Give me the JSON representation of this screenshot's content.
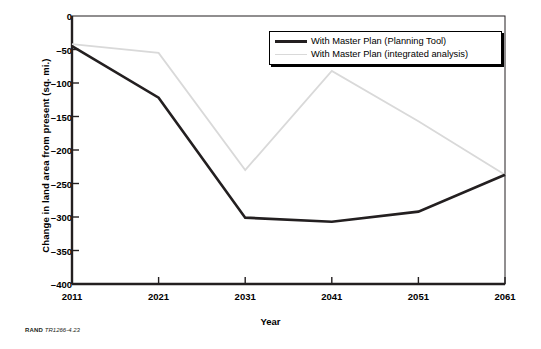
{
  "figure": {
    "credit_prefix": "RAND",
    "credit_id": "TR1266-4.23"
  },
  "chart_data": {
    "type": "line",
    "title": "",
    "xlabel": "Year",
    "ylabel": "Change in land area from present (sq. mi.)",
    "x": [
      2011,
      2021,
      2031,
      2041,
      2051,
      2061
    ],
    "xtick_labels": [
      "2011",
      "2021",
      "2031",
      "2041",
      "2051",
      "2061"
    ],
    "ytick_labels": [
      "0",
      "–50",
      "–100",
      "–150",
      "–200",
      "–250",
      "–300",
      "–350",
      "–400"
    ],
    "ytick_values": [
      0,
      -50,
      -100,
      -150,
      -200,
      -250,
      -300,
      -350,
      -400
    ],
    "ylim": [
      -400,
      0
    ],
    "xlim": [
      2011,
      2061
    ],
    "grid": false,
    "legend_position": "top-right",
    "series": [
      {
        "name": "With Master Plan (Planning Tool)",
        "color": "#231f20",
        "width": 2.6,
        "values": [
          -45,
          -122,
          -301,
          -307,
          -292,
          -237
        ]
      },
      {
        "name": "With Master Plan (integrated analysis)",
        "color": "#d9d9d9",
        "width": 1.8,
        "values": [
          -42,
          -55,
          -230,
          -82,
          -157,
          -237
        ]
      }
    ]
  }
}
